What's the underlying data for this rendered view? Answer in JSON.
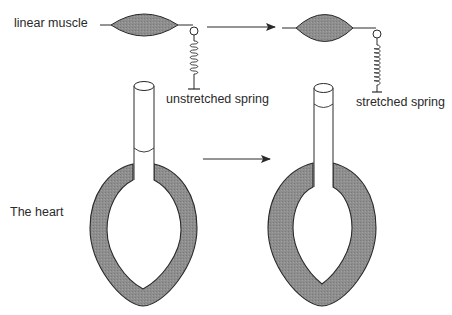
{
  "diagram": {
    "type": "schematic comparison",
    "colors": {
      "tissue_fill": "#8f8f8f",
      "stroke": "#2a2a2a",
      "background": "#ffffff"
    },
    "labels": {
      "linear_muscle": "linear muscle",
      "unstretched_spring": "unstretched spring",
      "stretched_spring": "stretched spring",
      "the_heart": "The heart"
    },
    "rows": [
      {
        "name": "linear muscle",
        "before": {
          "state": "unstretched spring"
        },
        "after": {
          "state": "stretched spring"
        },
        "transition": "arrow-right"
      },
      {
        "name": "The heart",
        "before": {
          "state": "normal ventricle"
        },
        "after": {
          "state": "thickened ventricle wall"
        },
        "transition": "arrow-right"
      }
    ]
  }
}
